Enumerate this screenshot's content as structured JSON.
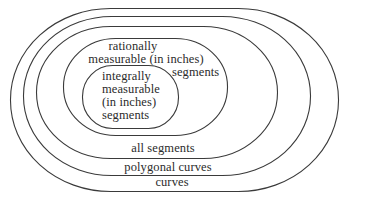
{
  "diagram": {
    "type": "nested-set (Euler) diagram",
    "stroke_color": "#3a3a3a",
    "background_color": "#ffffff",
    "sets": [
      {
        "id": "curves",
        "label": "curves",
        "level": 1
      },
      {
        "id": "polygonal-curves",
        "label": "polygonal curves",
        "level": 2
      },
      {
        "id": "all-segments",
        "label": "all segments",
        "level": 3
      },
      {
        "id": "rationally-measurable-segments",
        "label_lines": [
          "rationally",
          "measurable (in inches)",
          "segments"
        ],
        "level": 4
      },
      {
        "id": "integrally-measurable-segments",
        "label_lines": [
          "integrally",
          "measurable",
          "(in inches)",
          "segments"
        ],
        "level": 5
      }
    ]
  }
}
